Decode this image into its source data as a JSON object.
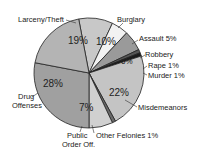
{
  "chart_data": {
    "type": "pie",
    "title": "",
    "slices": [
      {
        "label": "Burglary",
        "value": 10,
        "pct_label": "10%",
        "color": "#c8c8c8"
      },
      {
        "label": "Assault",
        "value": 5,
        "pct_label": "5%",
        "color": "#f2f2f2"
      },
      {
        "label": "Robbery",
        "value": 6,
        "pct_label": "6%",
        "color": "#9a9a9a"
      },
      {
        "label": "Rape",
        "value": 1,
        "pct_label": "1%",
        "color": "#555555"
      },
      {
        "label": "Murder",
        "value": 1,
        "pct_label": "1%",
        "color": "#1a1a1a"
      },
      {
        "label": "Misdemeanors",
        "value": 22,
        "pct_label": "22%",
        "color": "#c4c4c4"
      },
      {
        "label": "Other Felonies",
        "value": 1,
        "pct_label": "1%",
        "color": "#6a6a6a"
      },
      {
        "label": "Public Order Off.",
        "value": 7,
        "pct_label": "7%",
        "color": "#d0d0d0"
      },
      {
        "label": "Drug Offenses",
        "value": 28,
        "pct_label": "28%",
        "color": "#a0a0a0"
      },
      {
        "label": "Larceny/Theft",
        "value": 19,
        "pct_label": "19%",
        "color": "#b4b4b4"
      }
    ]
  },
  "labels": {
    "larceny": "Larceny/Theft",
    "burglary": "Burglary",
    "assault": "Assault  5%",
    "robbery": "Robbery",
    "rape": "Rape  1%",
    "murder": "Murder  1%",
    "misdemeanors": "Misdemeanors",
    "other_felonies": "Other Felonies  1%",
    "public_order_1": "Public",
    "public_order_2": "Order Off.",
    "drug_1": "Drug",
    "drug_2": "Offenses"
  },
  "pcts": {
    "larceny": "19%",
    "burglary": "10%",
    "robbery": "6%",
    "misdemeanors": "22%",
    "public_order": "7%",
    "drug": "28%"
  }
}
